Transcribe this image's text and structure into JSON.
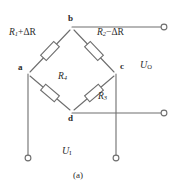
{
  "figure": {
    "caption": "(a)",
    "line_color": "#6e6e6e",
    "text_color": "#2b2b2b",
    "background": "#ffffff"
  },
  "nodes": [
    {
      "id": "a",
      "label": "a",
      "x": 27,
      "y": 68
    },
    {
      "id": "b",
      "label": "b",
      "x": 72,
      "y": 22
    },
    {
      "id": "c",
      "label": "c",
      "x": 117,
      "y": 68
    },
    {
      "id": "d",
      "label": "d",
      "x": 72,
      "y": 114
    }
  ],
  "resistors": [
    {
      "id": "r1",
      "name": "R1-plus-delta-R",
      "symbol": "R",
      "subscript": "1",
      "operator": "+",
      "delta": "ΔR",
      "full_label": "R₁+ΔR",
      "branch": "a-b"
    },
    {
      "id": "r2",
      "name": "R2-minus-delta-R",
      "symbol": "R",
      "subscript": "2",
      "operator": "−",
      "delta": "ΔR",
      "full_label": "R₂−ΔR",
      "branch": "b-c"
    },
    {
      "id": "r3",
      "name": "R3",
      "symbol": "R",
      "subscript": "3",
      "operator": "",
      "delta": "",
      "full_label": "R₃",
      "branch": "c-d"
    },
    {
      "id": "r4",
      "name": "R4",
      "symbol": "R",
      "subscript": "4",
      "operator": "",
      "delta": "",
      "full_label": "R₄",
      "branch": "a-d"
    }
  ],
  "voltages": [
    {
      "id": "uo",
      "symbol": "U",
      "subscript": "O",
      "full_label": "U₀",
      "role": "output",
      "x": 143,
      "y": 62
    },
    {
      "id": "ui",
      "symbol": "U",
      "subscript": "I",
      "full_label": "U₁",
      "role": "input",
      "x": 64,
      "y": 150
    }
  ],
  "terminals": [
    {
      "id": "t-out-top",
      "name": "output-terminal-top",
      "x": 165,
      "y": 22
    },
    {
      "id": "t-out-bottom",
      "name": "output-terminal-bottom",
      "x": 165,
      "y": 114
    },
    {
      "id": "t-in-left",
      "name": "input-terminal-left",
      "x": 27,
      "y": 159
    },
    {
      "id": "t-in-right",
      "name": "input-terminal-right",
      "x": 117,
      "y": 159
    }
  ]
}
